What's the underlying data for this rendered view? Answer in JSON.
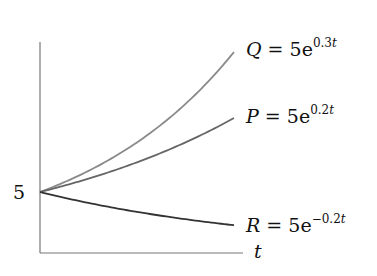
{
  "chart_data": {
    "type": "line",
    "title": "",
    "xlabel": "t",
    "ylabel": "",
    "x_range": [
      0,
      4
    ],
    "grid": false,
    "legend_position": "inline-right",
    "y_tick_labels": [
      "5"
    ],
    "y_ticks": [
      5
    ],
    "series": [
      {
        "name": "Q",
        "formula": "Q = 5e^{0.3t}",
        "a": 5,
        "r": 0.3,
        "color": "#8a8a8a",
        "x": [
          0,
          1,
          2,
          3,
          4
        ],
        "values": [
          5,
          6.75,
          9.11,
          12.3,
          16.6
        ]
      },
      {
        "name": "P",
        "formula": "P = 5e^{0.2t}",
        "a": 5,
        "r": 0.2,
        "color": "#666666",
        "x": [
          0,
          1,
          2,
          3,
          4
        ],
        "values": [
          5,
          6.11,
          7.46,
          9.11,
          11.13
        ]
      },
      {
        "name": "R",
        "formula": "R = 5e^{-0.2t}",
        "a": 5,
        "r": -0.2,
        "color": "#333333",
        "x": [
          0,
          1,
          2,
          3,
          4
        ],
        "values": [
          5,
          4.09,
          3.35,
          2.74,
          2.25
        ]
      }
    ]
  },
  "labels": {
    "y_tick": "5",
    "x_axis": "t",
    "Q": {
      "lhs": "Q",
      "eq": " = 5e",
      "exp_num": "0.3",
      "exp_var": "t"
    },
    "P": {
      "lhs": "P",
      "eq": " = 5e",
      "exp_num": "0.2",
      "exp_var": "t"
    },
    "R": {
      "lhs": "R",
      "eq": " = 5e",
      "exp_num": "−0.2",
      "exp_var": "t"
    }
  },
  "colors": {
    "axis": "#777777",
    "Q": "#8a8a8a",
    "P": "#666666",
    "R": "#333333"
  }
}
